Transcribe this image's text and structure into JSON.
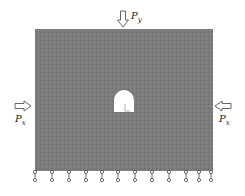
{
  "diagram": {
    "type": "tunnel-plate-loading",
    "plate": {
      "x": 35,
      "y": 29,
      "width": 178,
      "height": 142,
      "fill": "#7a7a7a"
    },
    "tunnel": {
      "cx": 124,
      "cy": 104,
      "fill": "#ffffff"
    },
    "loads": {
      "top": {
        "symbol": "P",
        "subscript": "y"
      },
      "left": {
        "symbol": "P",
        "subscript": "x"
      },
      "right": {
        "symbol": "P",
        "subscript": "x"
      }
    },
    "supports_x": [
      35,
      52,
      69,
      86,
      102,
      118,
      135,
      152,
      169,
      186,
      199,
      211
    ],
    "colors": {
      "plate": "#7a7a7a",
      "arrow": "#555555",
      "support": "#444444"
    }
  }
}
